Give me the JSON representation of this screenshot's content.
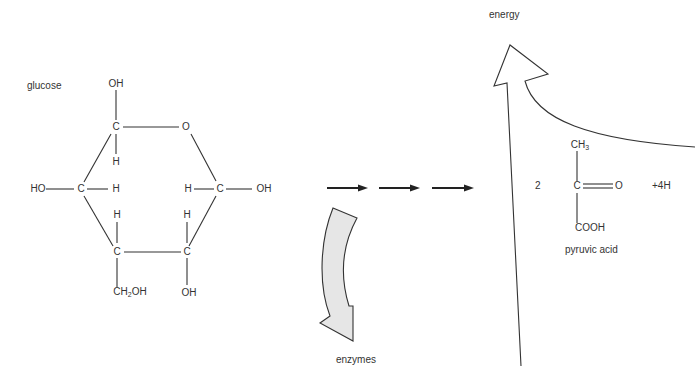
{
  "diagram": {
    "labels": {
      "glucose": "glucose",
      "energy": "energy",
      "enzymes": "enzymes",
      "pyruvic_acid": "pyruvic acid",
      "coefficient": "2",
      "hydrogen": "+4H"
    },
    "glucose_atoms": {
      "c1_oh": "OH",
      "c1": "C",
      "c1_h": "H",
      "ring_o": "O",
      "c2_ho": "HO",
      "c2": "C",
      "c2_h": "H",
      "c5_h": "H",
      "c5": "C",
      "c5_oh": "OH",
      "c3_h": "H",
      "c3": "C",
      "c3_ch2oh_main": "CH",
      "c3_ch2oh_sub": "2",
      "c3_ch2oh_tail": "OH",
      "c4_h": "H",
      "c4": "C",
      "c4_oh": "OH"
    },
    "pyruvic_atoms": {
      "ch3_main": "CH",
      "ch3_sub": "3",
      "c": "C",
      "o": "O",
      "cooh": "COOH"
    },
    "process_arrows": 3,
    "colors": {
      "line": "#333333",
      "enzyme_arrow_fill": "#e6e6e6",
      "background": "#ffffff"
    }
  }
}
